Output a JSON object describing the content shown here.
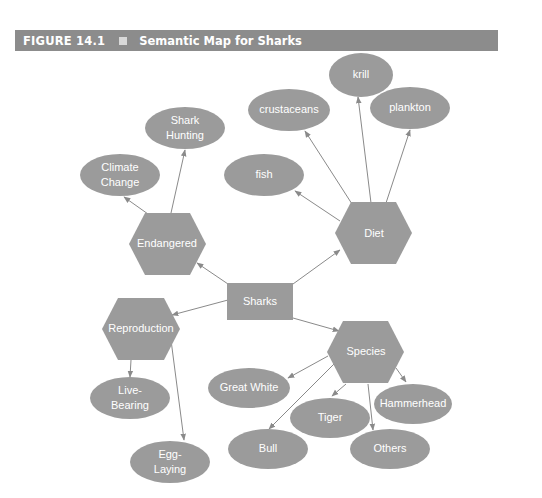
{
  "header": {
    "figure_number": "FIGURE 14.1",
    "title": "Semantic Map for Sharks"
  },
  "colors": {
    "header_bg": "#8c8c8c",
    "node_fill": "#9b9b9b",
    "edge": "#8a8a8a",
    "text": "#ffffff"
  },
  "nodes": {
    "sharks": {
      "label": "Sharks",
      "shape": "rectangle"
    },
    "endangered": {
      "label": "Endangered",
      "shape": "hexagon"
    },
    "diet": {
      "label": "Diet",
      "shape": "hexagon"
    },
    "reproduction": {
      "label": "Reproduction",
      "shape": "hexagon"
    },
    "species": {
      "label": "Species",
      "shape": "hexagon"
    },
    "climate_change": {
      "line1": "Climate",
      "line2": "Change",
      "shape": "ellipse"
    },
    "shark_hunting": {
      "line1": "Shark",
      "line2": "Hunting",
      "shape": "ellipse"
    },
    "fish": {
      "label": "fish",
      "shape": "ellipse"
    },
    "crustaceans": {
      "label": "crustaceans",
      "shape": "ellipse"
    },
    "krill": {
      "label": "krill",
      "shape": "ellipse"
    },
    "plankton": {
      "label": "plankton",
      "shape": "ellipse"
    },
    "live_bearing": {
      "line1": "Live-",
      "line2": "Bearing",
      "shape": "ellipse"
    },
    "egg_laying": {
      "line1": "Egg-",
      "line2": "Laying",
      "shape": "ellipse"
    },
    "great_white": {
      "label": "Great White",
      "shape": "ellipse"
    },
    "tiger": {
      "label": "Tiger",
      "shape": "ellipse"
    },
    "hammerhead": {
      "label": "Hammerhead",
      "shape": "ellipse"
    },
    "bull": {
      "label": "Bull",
      "shape": "ellipse"
    },
    "others": {
      "label": "Others",
      "shape": "ellipse"
    }
  },
  "edges": [
    {
      "from": "Sharks",
      "to": "Endangered"
    },
    {
      "from": "Sharks",
      "to": "Diet"
    },
    {
      "from": "Sharks",
      "to": "Reproduction"
    },
    {
      "from": "Sharks",
      "to": "Species"
    },
    {
      "from": "Endangered",
      "to": "Climate Change"
    },
    {
      "from": "Endangered",
      "to": "Shark Hunting"
    },
    {
      "from": "Diet",
      "to": "fish"
    },
    {
      "from": "Diet",
      "to": "crustaceans"
    },
    {
      "from": "Diet",
      "to": "krill"
    },
    {
      "from": "Diet",
      "to": "plankton"
    },
    {
      "from": "Reproduction",
      "to": "Live-Bearing"
    },
    {
      "from": "Reproduction",
      "to": "Egg-Laying"
    },
    {
      "from": "Species",
      "to": "Great White"
    },
    {
      "from": "Species",
      "to": "Tiger"
    },
    {
      "from": "Species",
      "to": "Hammerhead"
    },
    {
      "from": "Species",
      "to": "Bull"
    },
    {
      "from": "Species",
      "to": "Others"
    }
  ]
}
